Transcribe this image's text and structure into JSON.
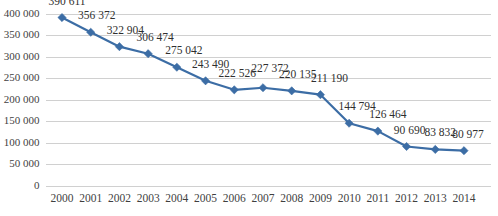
{
  "chart_data": {
    "type": "line",
    "title": "",
    "subtitle": "",
    "xlabel": "",
    "ylabel": "",
    "categories": [
      "2000",
      "2001",
      "2002",
      "2003",
      "2004",
      "2005",
      "2006",
      "2007",
      "2008",
      "2009",
      "2010",
      "2011",
      "2012",
      "2013",
      "2014"
    ],
    "values": [
      390611,
      356372,
      322904,
      306474,
      275042,
      243490,
      222526,
      227372,
      220135,
      211190,
      144794,
      126464,
      90690,
      83832,
      80977
    ],
    "data_labels": [
      "390 611",
      "356 372",
      "322 904",
      "306 474",
      "275 042",
      "243 490",
      "222 526",
      "227 372",
      "220 135",
      "211 190",
      "144 794",
      "126 464",
      "90 690",
      "83 832",
      "80 977"
    ],
    "ylim": [
      0,
      400000
    ],
    "ytick_values": [
      0,
      50000,
      100000,
      150000,
      200000,
      250000,
      300000,
      350000,
      400000
    ],
    "ytick_labels": [
      "0",
      "50 000",
      "100 000",
      "150 000",
      "200 000",
      "250 000",
      "300 000",
      "350 000",
      "400 000"
    ],
    "grid": {
      "horizontal": true,
      "vertical": false
    },
    "legend": {
      "visible": false,
      "position": "none"
    },
    "series_color": "#3c6da5",
    "gridline_color": "#d0d0d0",
    "marker": "diamond",
    "show_data_labels": true
  }
}
